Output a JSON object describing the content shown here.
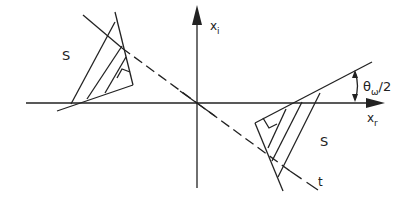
{
  "diagram": {
    "axes": {
      "horizontal_label": "x",
      "horizontal_sub": "r",
      "vertical_label": "x",
      "vertical_sub": "i"
    },
    "regions": {
      "left_label": "S",
      "right_label": "S"
    },
    "line_label": "t",
    "angle_label": "θ",
    "angle_sub": "ω",
    "angle_suffix": "/2",
    "colors": {
      "ink": "#222222",
      "background": "#ffffff"
    }
  }
}
